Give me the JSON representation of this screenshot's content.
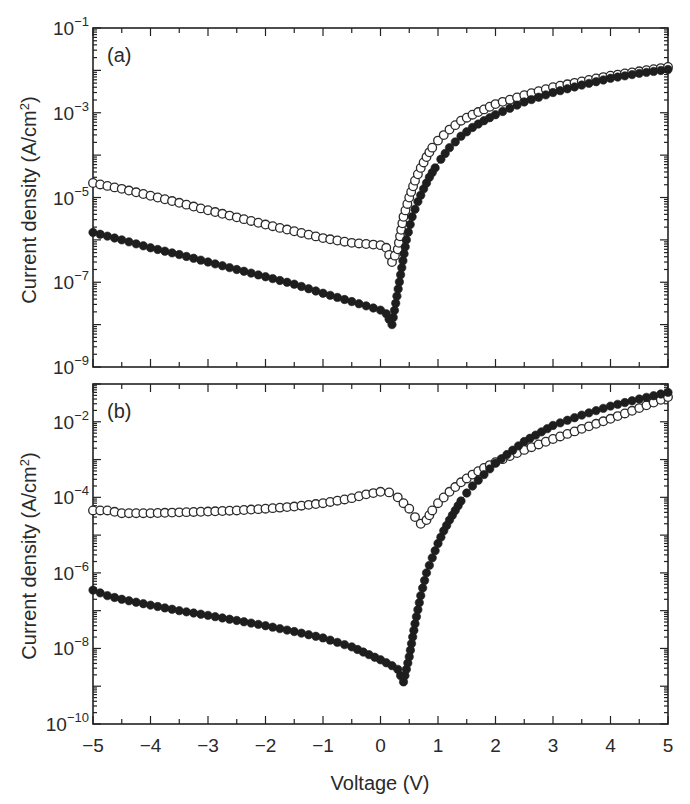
{
  "figure": {
    "x_label": "Voltage (V)",
    "y_label_text": "Current density (A/cm",
    "y_label_sup": "2",
    "y_label_close": ")",
    "colors": {
      "axis": "#222222",
      "filled_marker": "#1e1e1e",
      "open_marker_stroke": "#2a2a2a",
      "open_marker_fill": "#ffffff",
      "line": "#333333"
    }
  },
  "chart_data": [
    {
      "type": "scatter",
      "panel_label": "(a)",
      "title": "",
      "xlabel": "",
      "ylabel": "Current density (A/cm²)",
      "xlim": [
        -5,
        5
      ],
      "ylim": [
        1e-09,
        0.1
      ],
      "yscale": "log",
      "x_ticks": [
        -5,
        -4,
        -3,
        -2,
        -1,
        0,
        1,
        2,
        3,
        4,
        5
      ],
      "x_tick_labels_shown": false,
      "y_ticks": [
        {
          "exp": "-1",
          "value": 0.1
        },
        {
          "exp": "-3",
          "value": 0.001
        },
        {
          "exp": "-5",
          "value": 1e-05
        },
        {
          "exp": "-7",
          "value": 1e-07
        },
        {
          "exp": "-9",
          "value": 1e-09
        }
      ],
      "grid": false,
      "legend": "none",
      "series": [
        {
          "name": "open circles",
          "marker": "open",
          "x": [
            -5.0,
            -4.5,
            -4.0,
            -3.5,
            -3.0,
            -2.5,
            -2.0,
            -1.5,
            -1.0,
            -0.5,
            0.0,
            0.1,
            0.2,
            0.3,
            0.4,
            0.5,
            0.6,
            0.7,
            0.8,
            0.9,
            1.0,
            1.2,
            1.4,
            1.6,
            1.8,
            2.0,
            2.5,
            3.0,
            3.5,
            4.0,
            4.5,
            5.0
          ],
          "y": [
            2.2e-05,
            1.6e-05,
            1.1e-05,
            7.5e-06,
            5e-06,
            3.4e-06,
            2.3e-06,
            1.6e-06,
            1.1e-06,
            8.5e-07,
            7.5e-07,
            6.5e-07,
            3e-07,
            6e-07,
            3.5e-06,
            1e-05,
            2.5e-05,
            5e-05,
            9e-05,
            0.00015,
            0.00022,
            0.0004,
            0.00065,
            0.0009,
            0.0012,
            0.0016,
            0.0026,
            0.004,
            0.0055,
            0.0075,
            0.0095,
            0.012
          ]
        },
        {
          "name": "filled circles",
          "marker": "filled",
          "x": [
            -5.0,
            -4.5,
            -4.0,
            -3.5,
            -3.0,
            -2.5,
            -2.0,
            -1.5,
            -1.0,
            -0.5,
            0.0,
            0.1,
            0.2,
            0.35,
            0.45,
            0.55,
            0.65,
            0.75,
            0.85,
            0.95,
            1.05,
            1.2,
            1.4,
            1.6,
            1.8,
            2.0,
            2.5,
            3.0,
            3.5,
            4.0,
            4.5,
            5.0
          ],
          "y": [
            1.5e-06,
            1e-06,
            6.5e-07,
            4.5e-07,
            3e-07,
            2e-07,
            1.35e-07,
            9e-08,
            5.5e-08,
            3.5e-08,
            2.2e-08,
            1.8e-08,
            1e-08,
            1.5e-07,
            1e-06,
            3.5e-06,
            8e-06,
            1.6e-05,
            3e-05,
            5e-05,
            8e-05,
            0.00015,
            0.00028,
            0.00045,
            0.00065,
            0.0009,
            0.0018,
            0.003,
            0.0045,
            0.0065,
            0.0085,
            0.0105
          ]
        }
      ]
    },
    {
      "type": "scatter",
      "panel_label": "(b)",
      "title": "",
      "xlabel": "Voltage (V)",
      "ylabel": "Current density (A/cm²)",
      "xlim": [
        -5,
        5
      ],
      "ylim": [
        1e-10,
        0.1
      ],
      "yscale": "log",
      "x_ticks": [
        -5,
        -4,
        -3,
        -2,
        -1,
        0,
        1,
        2,
        3,
        4,
        5
      ],
      "x_tick_labels": [
        "−5",
        "−4",
        "−3",
        "−2",
        "−1",
        "0",
        "1",
        "2",
        "3",
        "4",
        "5"
      ],
      "y_ticks": [
        {
          "exp": "-2",
          "value": 0.01
        },
        {
          "exp": "-4",
          "value": 0.0001
        },
        {
          "exp": "-6",
          "value": 1e-06
        },
        {
          "exp": "-8",
          "value": 1e-08
        },
        {
          "exp": "-10",
          "value": 1e-10
        }
      ],
      "grid": false,
      "legend": "none",
      "series": [
        {
          "name": "open circles",
          "marker": "open",
          "x": [
            -5.0,
            -4.75,
            -4.5,
            -4.0,
            -3.5,
            -3.0,
            -2.5,
            -2.0,
            -1.5,
            -1.0,
            -0.5,
            -0.25,
            0.0,
            0.15,
            0.3,
            0.4,
            0.5,
            0.6,
            0.7,
            0.8,
            0.9,
            1.0,
            1.2,
            1.4,
            1.6,
            1.8,
            2.0,
            2.5,
            3.0,
            3.5,
            4.0,
            4.5,
            5.0
          ],
          "y": [
            4.5e-05,
            4.5e-05,
            3.8e-05,
            3.8e-05,
            4e-05,
            4.2e-05,
            4.5e-05,
            5e-05,
            5.7e-05,
            7e-05,
            9.5e-05,
            0.00012,
            0.00014,
            0.000135,
            0.0001,
            7e-05,
            5e-05,
            3e-05,
            2e-05,
            2.5e-05,
            4.5e-05,
            7e-05,
            0.00014,
            0.00025,
            0.0004,
            0.0006,
            0.00085,
            0.0018,
            0.0035,
            0.0065,
            0.012,
            0.023,
            0.045
          ]
        },
        {
          "name": "filled circles",
          "marker": "filled",
          "x": [
            -5.0,
            -4.75,
            -4.5,
            -4.0,
            -3.5,
            -3.0,
            -2.5,
            -2.0,
            -1.5,
            -1.0,
            -0.5,
            0.0,
            0.2,
            0.3,
            0.4,
            0.5,
            0.6,
            0.7,
            0.8,
            0.9,
            1.0,
            1.1,
            1.2,
            1.3,
            1.4,
            1.5,
            1.6,
            1.8,
            2.0,
            2.5,
            3.0,
            3.5,
            4.0,
            4.5,
            5.0
          ],
          "y": [
            3.5e-07,
            2.5e-07,
            2e-07,
            1.4e-07,
            1e-07,
            7.5e-08,
            5.5e-08,
            4e-08,
            2.8e-08,
            1.9e-08,
            1.1e-08,
            5e-09,
            3.5e-09,
            2.8e-09,
            1.3e-09,
            6e-09,
            4.5e-08,
            2.5e-07,
            1e-06,
            2.5e-06,
            6e-06,
            1.3e-05,
            2.5e-05,
            4.5e-05,
            8e-05,
            0.00013,
            0.0002,
            0.0004,
            0.0008,
            0.003,
            0.008,
            0.015,
            0.026,
            0.04,
            0.06
          ]
        }
      ]
    }
  ]
}
